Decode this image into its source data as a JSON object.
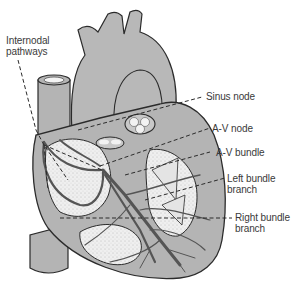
{
  "diagram": {
    "colors": {
      "background": "#ffffff",
      "tissue": "#b4b4b4",
      "tissue_light": "#c8c8c8",
      "chamber": "#ececec",
      "outline": "#2b2b2b",
      "fiber": "#555555",
      "leader": "#2b2b2b",
      "text": "#3a3a3a"
    },
    "labels": [
      {
        "id": "internodal",
        "line1": "Internodal",
        "line2": "pathways"
      },
      {
        "id": "sinus",
        "line1": "Sinus node"
      },
      {
        "id": "av_node",
        "line1": "A-V node"
      },
      {
        "id": "av_bundle",
        "line1": "A-V bundle"
      },
      {
        "id": "left_branch",
        "line1": "Left bundle",
        "line2": "branch"
      },
      {
        "id": "right_branch",
        "line1": "Right bundle",
        "line2": "branch"
      }
    ]
  }
}
